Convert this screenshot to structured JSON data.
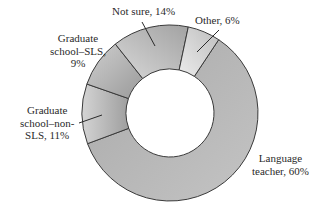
{
  "chart_data": {
    "type": "pie",
    "variant": "donut",
    "title": "",
    "categories": [
      "Language teacher",
      "Graduate school–non-SLS",
      "Graduate school–SLS",
      "Not sure",
      "Other"
    ],
    "values": [
      60,
      11,
      9,
      14,
      6
    ],
    "unit": "%",
    "labels": [
      {
        "lines": [
          "Language",
          "teacher, 60%"
        ]
      },
      {
        "lines": [
          "Graduate",
          "school–non-",
          "SLS, 11%"
        ]
      },
      {
        "lines": [
          "Graduate",
          "school–SLS,",
          "9%"
        ]
      },
      {
        "lines": [
          "Not sure, 14%"
        ]
      },
      {
        "lines": [
          "Other, 6%"
        ]
      }
    ],
    "legend": "none (direct labels)",
    "start_angle_deg": 33.6,
    "direction": "clockwise",
    "geometry": {
      "cx": 170,
      "cy": 113,
      "outer_r": 88,
      "inner_r": 44
    },
    "colors": {
      "segment_fill": "#b4b4b4",
      "segment_light": "#d6d6d6",
      "stroke": "#3a3a3a",
      "hole": "#ffffff"
    }
  }
}
